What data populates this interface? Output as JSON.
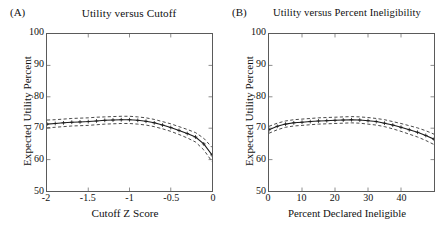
{
  "figure": {
    "background_color": "#ffffff",
    "line_color": "#1a1a1a",
    "frame_color": "#5a5a5a"
  },
  "chart_data": [
    {
      "type": "line",
      "panel_letter": "(A)",
      "title": "Utility versus Cutoff",
      "xlabel": "Cutoff Z Score",
      "ylabel": "Expected Utility Percent",
      "xlim": [
        -2,
        0
      ],
      "ylim": [
        50,
        100
      ],
      "xticks": [
        -2,
        -1.5,
        -1,
        -0.5,
        0
      ],
      "xtick_labels": [
        "-2",
        "-1.5",
        "-1",
        "-0.5",
        "0"
      ],
      "yticks": [
        50,
        60,
        70,
        80,
        90,
        100
      ],
      "ytick_labels": [
        "50",
        "60",
        "70",
        "80",
        "90",
        "100"
      ],
      "grid": false,
      "legend": "none",
      "x": [
        -2.0,
        -1.9,
        -1.8,
        -1.7,
        -1.6,
        -1.5,
        -1.4,
        -1.3,
        -1.2,
        -1.1,
        -1.0,
        -0.9,
        -0.8,
        -0.7,
        -0.6,
        -0.5,
        -0.4,
        -0.3,
        -0.2,
        -0.1,
        0.0
      ],
      "series": [
        {
          "name": "Expected utility (point estimate)",
          "style": "solid-with-plus-markers",
          "values": [
            71.3,
            71.5,
            71.7,
            71.9,
            72.0,
            72.1,
            72.3,
            72.5,
            72.6,
            72.7,
            72.7,
            72.5,
            72.2,
            71.7,
            71.0,
            70.2,
            69.3,
            68.3,
            67.2,
            65.0,
            61.5
          ]
        },
        {
          "name": "Upper confidence band",
          "style": "dashed",
          "values": [
            72.6,
            72.7,
            72.9,
            73.1,
            73.2,
            73.3,
            73.5,
            73.6,
            73.7,
            73.8,
            73.8,
            73.6,
            73.3,
            72.8,
            72.1,
            71.4,
            70.5,
            69.6,
            68.6,
            66.8,
            63.9
          ]
        },
        {
          "name": "Lower confidence band",
          "style": "dashed",
          "values": [
            70.1,
            70.3,
            70.5,
            70.7,
            70.8,
            70.9,
            71.1,
            71.3,
            71.4,
            71.5,
            71.5,
            71.3,
            71.0,
            70.5,
            69.8,
            69.0,
            68.0,
            66.9,
            65.6,
            63.1,
            59.4
          ]
        }
      ]
    },
    {
      "type": "line",
      "panel_letter": "(B)",
      "title": "Utility versus Percent Ineligibility",
      "xlabel": "Percent Declared Ineligible",
      "ylabel": "Expected Utility Percent",
      "xlim": [
        0,
        50
      ],
      "ylim": [
        50,
        100
      ],
      "xticks": [
        0,
        10,
        20,
        30,
        40
      ],
      "xtick_labels": [
        "0",
        "10",
        "20",
        "30",
        "40"
      ],
      "yticks": [
        50,
        60,
        70,
        80,
        90,
        100
      ],
      "ytick_labels": [
        "50",
        "60",
        "70",
        "80",
        "90",
        "100"
      ],
      "grid": false,
      "legend": "none",
      "x": [
        0,
        2.5,
        5,
        7.5,
        10,
        12.5,
        15,
        17.5,
        20,
        22.5,
        25,
        27.5,
        30,
        32.5,
        35,
        37.5,
        40,
        42.5,
        45,
        47.5,
        50
      ],
      "series": [
        {
          "name": "Expected utility (point estimate)",
          "style": "solid-with-plus-markers",
          "values": [
            69.5,
            70.6,
            71.3,
            71.7,
            71.9,
            72.1,
            72.3,
            72.4,
            72.5,
            72.6,
            72.7,
            72.6,
            72.4,
            72.1,
            71.6,
            71.0,
            70.3,
            69.5,
            68.7,
            67.7,
            66.5
          ]
        },
        {
          "name": "Upper confidence band",
          "style": "dashed",
          "values": [
            70.6,
            71.6,
            72.3,
            72.7,
            72.9,
            73.1,
            73.3,
            73.4,
            73.5,
            73.6,
            73.7,
            73.6,
            73.4,
            73.1,
            72.7,
            72.1,
            71.5,
            70.8,
            70.1,
            69.2,
            68.1
          ]
        },
        {
          "name": "Lower confidence band",
          "style": "dashed",
          "values": [
            68.4,
            69.5,
            70.3,
            70.7,
            70.9,
            71.1,
            71.3,
            71.4,
            71.5,
            71.6,
            71.7,
            71.6,
            71.3,
            71.0,
            70.5,
            69.8,
            69.0,
            68.1,
            67.2,
            66.1,
            64.8
          ]
        }
      ]
    }
  ]
}
